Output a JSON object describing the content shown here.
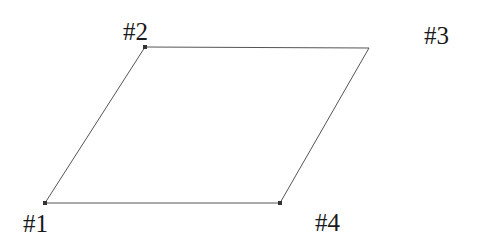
{
  "diagram": {
    "shape": "parallelogram",
    "stroke_color": "#555555",
    "vertex_color": "#333333",
    "vertices": [
      {
        "id": "1",
        "label": "#1",
        "x": 45,
        "y": 203,
        "marker": true
      },
      {
        "id": "2",
        "label": "#2",
        "x": 145,
        "y": 47,
        "marker": true
      },
      {
        "id": "3",
        "label": "#3",
        "x": 369,
        "y": 48,
        "marker": false
      },
      {
        "id": "4",
        "label": "#4",
        "x": 280,
        "y": 203,
        "marker": true
      }
    ]
  }
}
